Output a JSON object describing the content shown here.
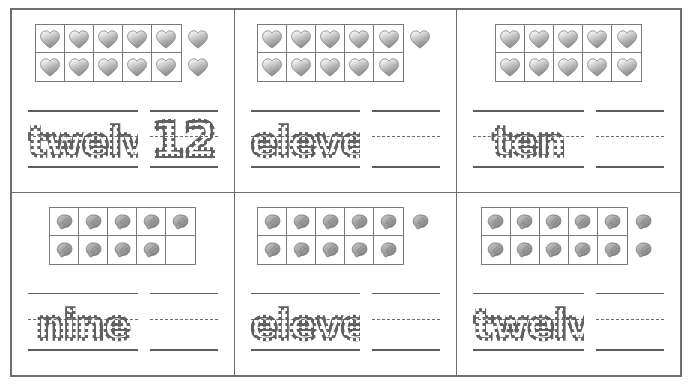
{
  "worksheet": {
    "title": "Ten Frame Counting — Trace the Number Word and Numeral",
    "token_types": {
      "heart": "heart-icon",
      "shell": "shell-icon"
    },
    "colors": {
      "border": "#6e6e6e",
      "guide_line": "#5d5d5d",
      "trace_ink": "#606060",
      "token_light": "#f2f2f2",
      "token_dark": "#8e8e8e"
    },
    "frame": {
      "columns": 5,
      "rows": 2,
      "capacity": 10
    },
    "cells": [
      {
        "id": "cell-1",
        "token": "heart",
        "filled": 10,
        "extras": 2,
        "total": 12,
        "word": "twelve",
        "numeral": "12"
      },
      {
        "id": "cell-2",
        "token": "heart",
        "filled": 10,
        "extras": 1,
        "total": 11,
        "word": "eleven",
        "numeral": ""
      },
      {
        "id": "cell-3",
        "token": "heart",
        "filled": 10,
        "extras": 0,
        "total": 10,
        "word": "ten",
        "numeral": ""
      },
      {
        "id": "cell-4",
        "token": "shell",
        "filled": 9,
        "extras": 0,
        "total": 9,
        "word": "nine",
        "numeral": ""
      },
      {
        "id": "cell-5",
        "token": "shell",
        "filled": 10,
        "extras": 1,
        "total": 11,
        "word": "eleven",
        "numeral": ""
      },
      {
        "id": "cell-6",
        "token": "shell",
        "filled": 10,
        "extras": 2,
        "total": 12,
        "word": "twelve",
        "numeral": ""
      }
    ]
  }
}
